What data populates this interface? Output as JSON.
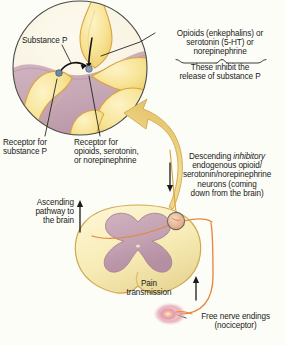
{
  "figure": {
    "background_color": "#fdfdf8"
  },
  "labels": {
    "substance_p": "Substance P",
    "neurotransmitters": "Opioids (enkephalins) or\nserotonin (5-HT) or\nnorepinephrine",
    "inhibit_note": "These inhibit the\nrelease of substance P",
    "receptor_substance_p": "Receptor for\nsubstance P",
    "receptor_opioid": "Receptor for\nopioids, serotonin,\nor norepinephrine",
    "descending_prefix": "Descending ",
    "descending_italic": "inhibitory",
    "descending_rest": "\nendogenous opioid/\nserotonin/norepinephrine\nneurons (coming\ndown from the brain)",
    "ascending_pathway": "Ascending\npathway to\nthe brain",
    "pain_transmission": "Pain\ntransmission",
    "free_nerve_endings": "Free nerve endings\n(nociceptor)"
  },
  "colors": {
    "neuron_yellow": "#f6e08a",
    "neuron_yellow_light": "#faeeb8",
    "neuron_outline": "#d9a441",
    "gray_matter": "#c3a2b2",
    "gray_matter_dark": "#b08fa2",
    "white_matter": "#f7eebc",
    "synapse_receptor": "#6f87a8",
    "nerve_fiber": "#e8873c",
    "nociceptor_glow": "#e9a0b4",
    "arrow_fill": "#f2d98a",
    "text": "#1a1a1a",
    "leader_line": "#1a1a1a"
  },
  "diagram": {
    "inset_circle": {
      "label": "magnified-synapse-inset",
      "center_x": 80,
      "center_y": 68,
      "radius": 68
    },
    "spinal_cord": {
      "label": "spinal-cord-cross-section",
      "center_x": 138,
      "center_y": 255
    },
    "synapse_node": {
      "label": "dorsal-horn-synapse",
      "center_x": 176,
      "center_y": 221,
      "radius": 9
    },
    "nociceptor": {
      "label": "free-nerve-ending",
      "center_x": 172,
      "center_y": 316
    }
  }
}
